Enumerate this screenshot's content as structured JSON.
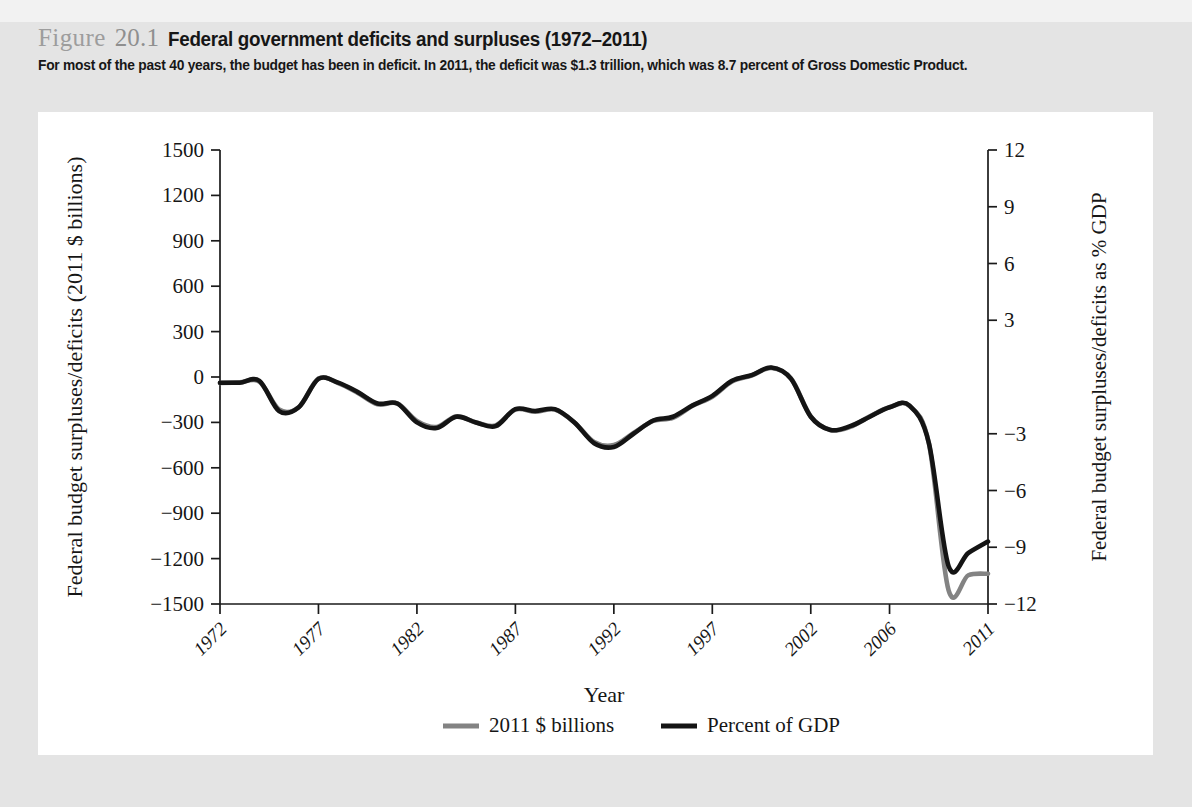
{
  "header": {
    "figure_word": "Figure",
    "figure_number": "20.1",
    "title": "Federal government deficits and surpluses (1972–2011)",
    "subtitle": "For most of the past 40 years, the budget has been in deficit. In 2011, the deficit was $1.3 trillion, which was 8.7 percent of Gross Domestic Product."
  },
  "chart_data": {
    "type": "line",
    "title": "Federal government deficits and surpluses (1972–2011)",
    "xlabel": "Year",
    "ylabel": "Federal budget surpluses/deficits (2011 $ billions)",
    "y2label": "Federal budget surpluses/deficits as % GDP",
    "xlim": [
      1972,
      2011
    ],
    "ylim": [
      -1500,
      1500
    ],
    "y2lim": [
      -12,
      12
    ],
    "xticks": [
      "1972",
      "1977",
      "1982",
      "1987",
      "1992",
      "1997",
      "2002",
      "2006",
      "2011"
    ],
    "xtick_values": [
      1972,
      1977,
      1982,
      1987,
      1992,
      1997,
      2002,
      2006,
      2011
    ],
    "yticks": [
      "1500",
      "1200",
      "900",
      "600",
      "300",
      "0",
      "−300",
      "−600",
      "−900",
      "−1200",
      "−1500"
    ],
    "ytick_values": [
      1500,
      1200,
      900,
      600,
      300,
      0,
      -300,
      -600,
      -900,
      -1200,
      -1500
    ],
    "y2ticks": [
      "12",
      "9",
      "6",
      "3",
      "−3",
      "−6",
      "−9",
      "−12"
    ],
    "y2tick_values": [
      12,
      9,
      6,
      3,
      -3,
      -6,
      -9,
      -12
    ],
    "grid": false,
    "legend_position": "bottom",
    "x": [
      1972,
      1973,
      1974,
      1975,
      1976,
      1977,
      1978,
      1979,
      1980,
      1981,
      1982,
      1983,
      1984,
      1985,
      1986,
      1987,
      1988,
      1989,
      1990,
      1991,
      1992,
      1993,
      1994,
      1995,
      1996,
      1997,
      1998,
      1999,
      2000,
      2001,
      2002,
      2003,
      2004,
      2005,
      2006,
      2007,
      2008,
      2009,
      2010,
      2011
    ],
    "series": [
      {
        "name": "2011 $ billions",
        "color": "#838383",
        "axis": "left",
        "values": [
          -40,
          -35,
          -30,
          -215,
          -200,
          -10,
          -40,
          -105,
          -180,
          -175,
          -290,
          -330,
          -260,
          -300,
          -320,
          -215,
          -230,
          -215,
          -300,
          -430,
          -450,
          -370,
          -290,
          -270,
          -190,
          -130,
          -30,
          10,
          60,
          -10,
          -260,
          -350,
          -330,
          -260,
          -200,
          -190,
          -440,
          -1410,
          -1310,
          -1300
        ]
      },
      {
        "name": "Percent of GDP",
        "color": "#141414",
        "axis": "right",
        "values": [
          -0.3,
          -0.3,
          -0.2,
          -1.8,
          -1.6,
          -0.1,
          -0.3,
          -0.8,
          -1.4,
          -1.4,
          -2.4,
          -2.7,
          -2.1,
          -2.4,
          -2.6,
          -1.7,
          -1.8,
          -1.7,
          -2.4,
          -3.5,
          -3.7,
          -3.0,
          -2.3,
          -2.1,
          -1.5,
          -1.0,
          -0.2,
          0.1,
          0.5,
          -0.1,
          -2.1,
          -2.8,
          -2.6,
          -2.1,
          -1.6,
          -1.5,
          -3.5,
          -10.0,
          -9.3,
          -8.7
        ]
      }
    ],
    "legend": [
      {
        "label": "2011 $ billions",
        "color": "#838383"
      },
      {
        "label": "Percent of GDP",
        "color": "#141414"
      }
    ]
  }
}
